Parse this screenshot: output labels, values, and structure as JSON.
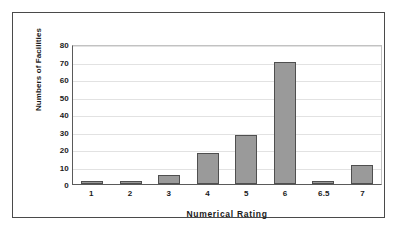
{
  "chart_data": {
    "type": "bar",
    "title": "",
    "xlabel": "Numerical Rating",
    "ylabel": "Numbers of Facilities",
    "categories": [
      "1",
      "2",
      "3",
      "4",
      "5",
      "6",
      "6.5",
      "7"
    ],
    "values": [
      2,
      2,
      5,
      18,
      28,
      70,
      2,
      11
    ],
    "ylim": [
      0,
      80
    ],
    "ytick_labels": [
      "0",
      "10",
      "20",
      "30",
      "40",
      "50",
      "60",
      "70",
      "80"
    ],
    "ytick_values": [
      0,
      10,
      20,
      30,
      40,
      50,
      60,
      70,
      80
    ],
    "grid": "horizontal",
    "legend": "none",
    "colors": {
      "bar_fill": "#9a9a9a",
      "bar_edge": "#4f4f4f",
      "gridline": "#e2e2e2",
      "axis": "#5a5a5a",
      "frame": "#4a4a4a",
      "background": "#ffffff",
      "text": "#1a1a1a"
    }
  }
}
